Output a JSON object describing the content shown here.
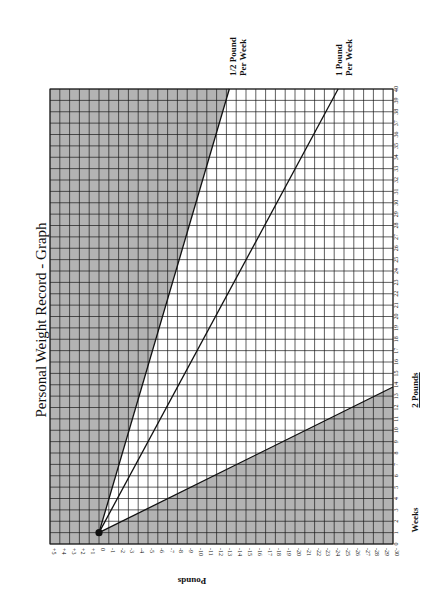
{
  "chart_data": {
    "type": "line",
    "title": "Personal Weight Record - Graph",
    "orientation": "page rotated 90°; pounds run horizontally (left to right), weeks run vertically (bottom to top)",
    "xlabel": "Pounds",
    "ylabel": "Weeks",
    "x_ticks": [
      "+5",
      "+4",
      "+3",
      "+2",
      "+1",
      "0",
      "-1",
      "-2",
      "-3",
      "-4",
      "-5",
      "-6",
      "-7",
      "-8",
      "-9",
      "-10",
      "-11",
      "-12",
      "-13",
      "-14",
      "-15",
      "-16",
      "-17",
      "-18",
      "-19",
      "-20",
      "-21",
      "-22",
      "-23",
      "-24",
      "-25",
      "-26",
      "-27",
      "-28",
      "-29",
      "-30"
    ],
    "y_ticks": [
      "0",
      "1",
      "2",
      "3",
      "4",
      "5",
      "6",
      "7",
      "8",
      "9",
      "10",
      "11",
      "12",
      "13",
      "14",
      "15",
      "16",
      "17",
      "18",
      "19",
      "20",
      "21",
      "22",
      "23",
      "24",
      "25",
      "26",
      "27",
      "28",
      "29",
      "30",
      "31",
      "32",
      "33",
      "34",
      "35",
      "36",
      "37",
      "38",
      "39",
      "40"
    ],
    "xlim": [
      5,
      -30
    ],
    "ylim": [
      0,
      40
    ],
    "grid": true,
    "start_point": {
      "pounds": 0,
      "week": 1
    },
    "series": [
      {
        "name": "1/2 Pound Per Week",
        "points": [
          {
            "pounds": 0,
            "week": 1
          },
          {
            "pounds": -13.3,
            "week": 40
          }
        ]
      },
      {
        "name": "1 Pound Per Week",
        "points": [
          {
            "pounds": 0,
            "week": 1
          },
          {
            "pounds": -24.4,
            "week": 40
          }
        ]
      },
      {
        "name": "2 Pounds",
        "points": [
          {
            "pounds": 0,
            "week": 1
          },
          {
            "pounds": -30,
            "week": 13.8
          }
        ]
      }
    ],
    "shaded_regions": [
      {
        "name": "too-slow region",
        "description": "left of 1/2 Pound Per Week line"
      },
      {
        "name": "too-fast region",
        "description": "below 2 Pounds line"
      }
    ],
    "line_labels": {
      "half": [
        "1/2 Pound",
        "Per Week"
      ],
      "one": [
        "1 Pound",
        "Per Week"
      ],
      "two": "2 Pounds"
    }
  },
  "colors": {
    "shade": "#b3b3b3",
    "grid": "#1a1a1a",
    "line": "#111111",
    "background": "#ffffff"
  },
  "geometry": {
    "left": 50,
    "top": 89,
    "right": 393,
    "bottom": 544
  }
}
